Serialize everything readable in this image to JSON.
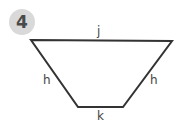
{
  "badge": {
    "number": "4"
  },
  "diagram": {
    "shape": "trapezoid",
    "labels": {
      "top": "j",
      "left": "h",
      "right": "h",
      "bottom": "k"
    },
    "stroke_color": "#333333"
  }
}
